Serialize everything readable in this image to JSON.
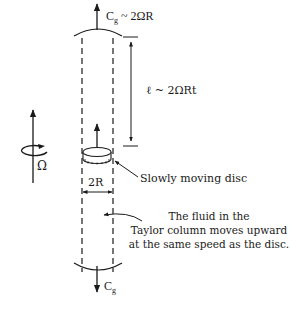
{
  "diagram": {
    "labels": {
      "cg_top_main": "C",
      "cg_top_sub": "g",
      "cg_top_rest": " ~ 2ΩR",
      "length_label": "ℓ ~ 2ΩRt",
      "disc_label": "Slowly moving disc",
      "width_label": "2R",
      "omega_label": "Ω",
      "cg_bottom_main": "C",
      "cg_bottom_sub": "g",
      "note_line1": "The fluid in the",
      "note_line2": "Taylor column moves upward",
      "note_line3": "at the same speed as the disc."
    },
    "colors": {
      "ink": "#1a1a1a",
      "background": "#ffffff"
    }
  }
}
